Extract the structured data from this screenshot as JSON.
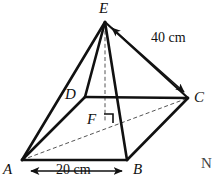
{
  "figure": {
    "type": "geometry-diagram",
    "solid_name": "square-based-pyramid",
    "stroke_color": "#111111",
    "dashed_color": "#555555",
    "background_color": "#ffffff",
    "vertices": [
      {
        "id": "E",
        "label": "E",
        "x": 105,
        "y": 22,
        "label_x": 100,
        "label_y": 1,
        "kind": "apex"
      },
      {
        "id": "D",
        "label": "D",
        "x": 85,
        "y": 97,
        "label_x": 66,
        "label_y": 88,
        "kind": "base-back-left"
      },
      {
        "id": "C",
        "label": "C",
        "x": 188,
        "y": 98,
        "label_x": 194,
        "label_y": 91,
        "kind": "base-back-right"
      },
      {
        "id": "A",
        "label": "A",
        "x": 22,
        "y": 160,
        "label_x": 3,
        "label_y": 163,
        "kind": "base-front-left"
      },
      {
        "id": "B",
        "label": "B",
        "x": 127,
        "y": 160,
        "label_x": 133,
        "label_y": 163,
        "kind": "base-front-right"
      },
      {
        "id": "F",
        "label": "F",
        "x": 105,
        "y": 122,
        "label_x": 88,
        "label_y": 113,
        "kind": "base-centre"
      }
    ],
    "solid_edges": [
      {
        "name": "edge-A-B",
        "from": "A",
        "to": "B"
      },
      {
        "name": "edge-B-C",
        "from": "B",
        "to": "C"
      },
      {
        "name": "edge-D-C",
        "from": "D",
        "to": "C"
      },
      {
        "name": "edge-A-D",
        "from": "A",
        "to": "D"
      },
      {
        "name": "edge-E-A",
        "from": "E",
        "to": "A"
      },
      {
        "name": "edge-E-B",
        "from": "E",
        "to": "B"
      },
      {
        "name": "edge-E-D",
        "from": "E",
        "to": "D"
      }
    ],
    "dashed_edges": [
      {
        "name": "edge-A-C-diagonal",
        "from": "A",
        "to": "C"
      },
      {
        "name": "edge-E-F-height",
        "from": "E",
        "to": "F"
      }
    ],
    "right_angle_mark": {
      "name": "right-angle-at-F",
      "x": 104,
      "y": 114,
      "size": 9
    },
    "dimensions": [
      {
        "id": "slant-EC",
        "label": "40 cm",
        "label_x": 152,
        "label_y": 32,
        "arrow_from_x": 110,
        "arrow_from_y": 26,
        "arrow_to_x": 186,
        "arrow_to_y": 94,
        "double_headed": true
      },
      {
        "id": "base-AB",
        "label": "20 cm",
        "label_x": 60,
        "label_y": 164,
        "arrow_from_x": 30,
        "arrow_from_y": 171,
        "arrow_to_x": 123,
        "arrow_to_y": 171,
        "double_headed": true
      }
    ],
    "page_margin_text": {
      "label": "N",
      "x": 201,
      "y": 157
    }
  }
}
